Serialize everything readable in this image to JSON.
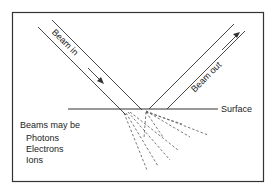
{
  "diagram": {
    "title": "",
    "labels": {
      "beam_in": "Beam in",
      "beam_out": "Beam out",
      "surface": "Surface"
    },
    "legend": {
      "heading": "Beams may be",
      "items": [
        "Photons",
        "Electrons",
        "Ions"
      ]
    },
    "colors": {
      "line": "#333333",
      "dashed": "#555555",
      "background": "#ffffff"
    }
  }
}
